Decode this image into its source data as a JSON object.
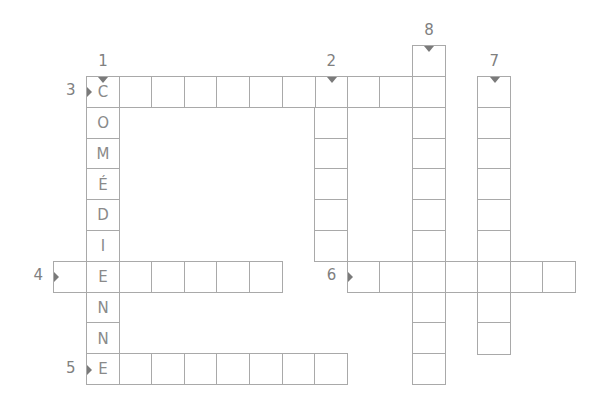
{
  "crossword": {
    "geometry": {
      "origin_x": 86,
      "origin_y": 76,
      "cell_w": 32.6,
      "cell_h": 30.8
    },
    "words": [
      {
        "number": "1",
        "direction": "down",
        "col": 0,
        "row": 0,
        "length": 10,
        "letters": [
          "C",
          "O",
          "M",
          "É",
          "D",
          "I",
          "E",
          "N",
          "N",
          "E"
        ]
      },
      {
        "number": "2",
        "direction": "down",
        "col": 7,
        "row": 0,
        "length": 6,
        "letters": []
      },
      {
        "number": "3",
        "direction": "across",
        "col": 0,
        "row": 0,
        "length": 11,
        "letters": [
          "C"
        ]
      },
      {
        "number": "4",
        "direction": "across",
        "col": -1,
        "row": 6,
        "length": 7,
        "letters": [
          "",
          "E"
        ]
      },
      {
        "number": "5",
        "direction": "across",
        "col": 0,
        "row": 9,
        "length": 8,
        "letters": [
          "E"
        ]
      },
      {
        "number": "6",
        "direction": "across",
        "col": 8,
        "row": 6,
        "length": 7,
        "letters": []
      },
      {
        "number": "7",
        "direction": "down",
        "col": 12,
        "row": 0,
        "length": 9,
        "letters": []
      },
      {
        "number": "8",
        "direction": "down",
        "col": 10,
        "row": -1,
        "length": 11,
        "letters": []
      }
    ]
  }
}
